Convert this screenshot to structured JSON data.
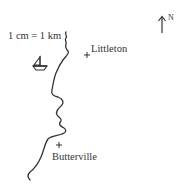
{
  "map": {
    "scale_label": "1 cm = 1 km",
    "north_label": "N",
    "places": [
      {
        "name": "Littleton",
        "marker": "cross"
      },
      {
        "name": "Butterville",
        "marker": "cross"
      }
    ],
    "icons": {
      "boat": "sailboat-icon",
      "north_arrow": "north-arrow-icon"
    },
    "colors": {
      "line": "#333333",
      "background": "#ffffff"
    }
  }
}
